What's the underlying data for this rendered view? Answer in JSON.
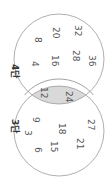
{
  "diagram": {
    "type": "venn",
    "orientation_rotation_deg": 90,
    "colors": {
      "circle_stroke": "#9a9a9a",
      "intersection_fill": "#d9d9d9",
      "text": "#555555"
    },
    "sets": [
      {
        "id": "four",
        "label": "4단",
        "only_items": [
          "4",
          "8",
          "16",
          "20",
          "28",
          "32",
          "36"
        ]
      },
      {
        "id": "three",
        "label": "3단",
        "only_items": [
          "3",
          "6",
          "9",
          "15",
          "18",
          "21",
          "27"
        ]
      }
    ],
    "intersection": [
      "12",
      "24"
    ]
  }
}
